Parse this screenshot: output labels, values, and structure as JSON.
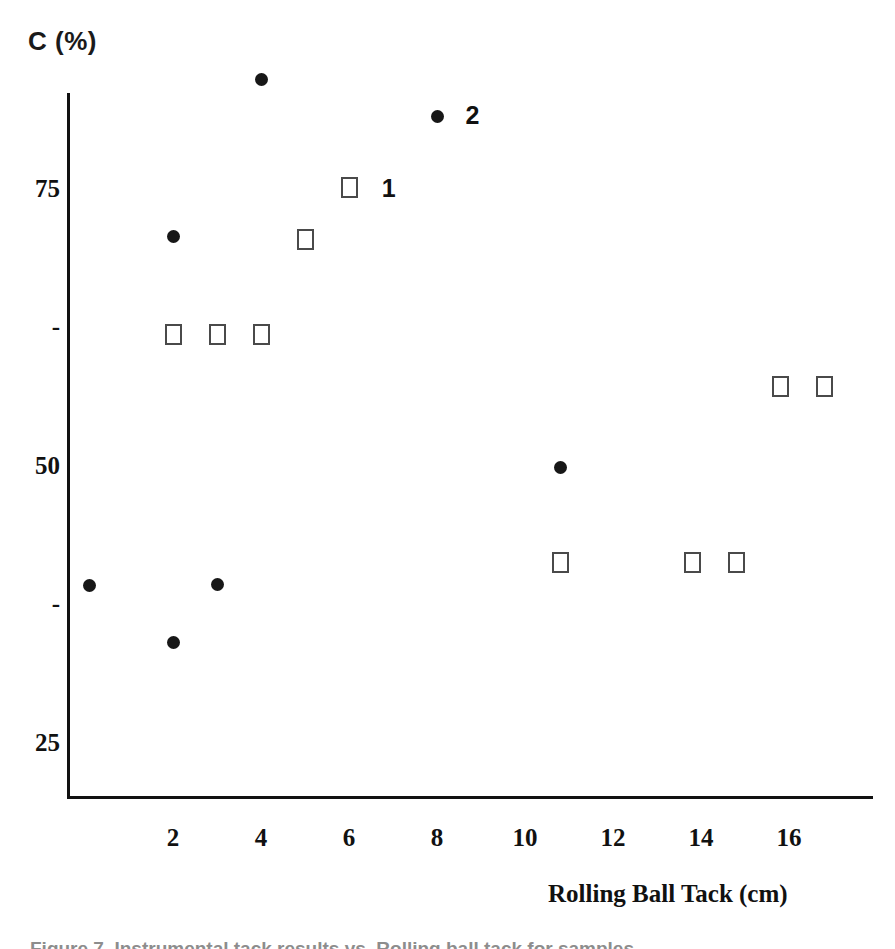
{
  "figure": {
    "caption_partial": "Figure 7. Instrumental tack results vs. Rolling ball tack for samples",
    "background_color": "#ffffff",
    "ink_color": "#111111"
  },
  "chart_data": {
    "type": "scatter",
    "title": "",
    "ylabel": "C (%)",
    "xlabel": "Rolling Ball Tack (cm)",
    "xlim": [
      0,
      18.3
    ],
    "ylim": [
      20.5,
      88
    ],
    "grid": false,
    "legend_position": "inline-right-of-point",
    "y_ticks": [
      {
        "value": 75,
        "label": "75",
        "type": "major"
      },
      {
        "value": 62.5,
        "label": "-",
        "type": "minor"
      },
      {
        "value": 50,
        "label": "50",
        "type": "major"
      },
      {
        "value": 37.5,
        "label": "-",
        "type": "minor"
      },
      {
        "value": 25,
        "label": "25",
        "type": "major"
      }
    ],
    "x_ticks": [
      {
        "value": 2,
        "label": "2"
      },
      {
        "value": 4,
        "label": "4"
      },
      {
        "value": 6,
        "label": "6"
      },
      {
        "value": 8,
        "label": "8"
      },
      {
        "value": 10,
        "label": "10"
      },
      {
        "value": 12,
        "label": "12"
      },
      {
        "value": 14,
        "label": "14"
      },
      {
        "value": 16,
        "label": "16"
      }
    ],
    "series": [
      {
        "name": "1",
        "marker": "open-square",
        "marker_color": "#4a4a4a",
        "label_x": 6.95,
        "label_y": 75.0,
        "points": [
          {
            "x": 2.0,
            "y": 62.0
          },
          {
            "x": 3.0,
            "y": 62.0
          },
          {
            "x": 4.0,
            "y": 62.0
          },
          {
            "x": 5.0,
            "y": 70.5
          },
          {
            "x": 6.0,
            "y": 75.2
          },
          {
            "x": 10.8,
            "y": 41.4
          },
          {
            "x": 13.8,
            "y": 41.4
          },
          {
            "x": 14.8,
            "y": 41.4
          },
          {
            "x": 15.8,
            "y": 57.3
          },
          {
            "x": 16.8,
            "y": 57.3
          }
        ]
      },
      {
        "name": "2",
        "marker": "filled-circle",
        "marker_color": "#171717",
        "label_x": 8.85,
        "label_y": 81.6,
        "points": [
          {
            "x": 0.1,
            "y": 39.3
          },
          {
            "x": 2.0,
            "y": 70.8
          },
          {
            "x": 2.0,
            "y": 34.2
          },
          {
            "x": 3.0,
            "y": 39.4
          },
          {
            "x": 4.0,
            "y": 85.0
          },
          {
            "x": 8.0,
            "y": 81.6
          },
          {
            "x": 10.8,
            "y": 50.0
          }
        ]
      }
    ]
  }
}
